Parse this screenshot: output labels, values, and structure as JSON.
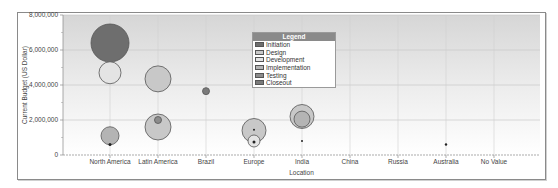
{
  "chart_data": {
    "type": "bubble",
    "title": "",
    "xlabel": "Location",
    "ylabel": "Current Budget (US Dollar)",
    "ylim": [
      0,
      8000000
    ],
    "yticks": [
      "0",
      "2,000,000",
      "4,000,000",
      "6,000,000",
      "8,000,000"
    ],
    "categories": [
      "North America",
      "Latin America",
      "Brazil",
      "Europe",
      "India",
      "China",
      "Russia",
      "Australia",
      "No Value"
    ],
    "legend": {
      "title": "Legend",
      "position": "top-center",
      "entries": [
        {
          "label": "Initiation",
          "color": "#6e6e6e"
        },
        {
          "label": "Design",
          "color": "#c8c8c8"
        },
        {
          "label": "Development",
          "color": "#e4e4e4"
        },
        {
          "label": "Implementation",
          "color": "#b4b4b4"
        },
        {
          "label": "Testing",
          "color": "#8c8c8c"
        },
        {
          "label": "Closeout",
          "color": "#7a7a7a"
        }
      ]
    },
    "series": [
      {
        "category": "North America",
        "phase": "Initiation",
        "y": 6400000,
        "size": 19
      },
      {
        "category": "North America",
        "phase": "Development",
        "y": 4700000,
        "size": 11
      },
      {
        "category": "North America",
        "phase": "Implementation",
        "y": 1100000,
        "size": 9
      },
      {
        "category": "North America",
        "phase": "Testing",
        "y": 600000,
        "size": 1.5
      },
      {
        "category": "Latin America",
        "phase": "Design",
        "y": 4350000,
        "size": 13
      },
      {
        "category": "Latin America",
        "phase": "Design",
        "y": 1600000,
        "size": 13
      },
      {
        "category": "Latin America",
        "phase": "Testing",
        "y": 2000000,
        "size": 3.5
      },
      {
        "category": "Brazil",
        "phase": "Closeout",
        "y": 3650000,
        "size": 3.5
      },
      {
        "category": "Europe",
        "phase": "Design",
        "y": 1400000,
        "size": 12
      },
      {
        "category": "Europe",
        "phase": "Development",
        "y": 800000,
        "size": 6
      },
      {
        "category": "Europe",
        "phase": "Initiation",
        "y": 750000,
        "size": 1.5
      },
      {
        "category": "Europe",
        "phase": "Initiation",
        "y": 1450000,
        "size": 1
      },
      {
        "category": "India",
        "phase": "Design",
        "y": 2200000,
        "size": 12
      },
      {
        "category": "India",
        "phase": "Implementation",
        "y": 2050000,
        "size": 8
      },
      {
        "category": "India",
        "phase": "Initiation",
        "y": 800000,
        "size": 1
      },
      {
        "category": "Australia",
        "phase": "Initiation",
        "y": 600000,
        "size": 1.2
      }
    ],
    "grid": true
  }
}
